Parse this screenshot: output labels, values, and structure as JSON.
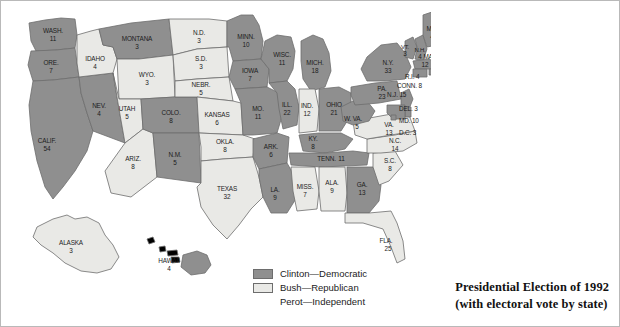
{
  "map": {
    "title_line1": "Presidential Election of 1992",
    "title_line2": "(with electoral vote by state)",
    "colors": {
      "clinton": "#8f8f8f",
      "bush": "#e9e9e6",
      "border": "#6d6d6d",
      "text": "#1c1c1c",
      "background": "#ffffff"
    }
  },
  "legend": {
    "items": [
      {
        "label": "Clinton—Democratic",
        "swatch": "#8f8f8f",
        "has_swatch": true
      },
      {
        "label": "Bush—Republican",
        "swatch": "#e9e9e6",
        "has_swatch": true
      },
      {
        "label": "Perot—Independent",
        "swatch": "",
        "has_swatch": false
      }
    ]
  },
  "states": [
    {
      "code": "WASH",
      "label": "WASH.",
      "votes": "11",
      "winner": "clinton"
    },
    {
      "code": "ORE",
      "label": "ORE.",
      "votes": "7",
      "winner": "clinton"
    },
    {
      "code": "CALIF",
      "label": "CALIF.",
      "votes": "54",
      "winner": "clinton"
    },
    {
      "code": "NEV",
      "label": "NEV.",
      "votes": "4",
      "winner": "clinton"
    },
    {
      "code": "IDAHO",
      "label": "IDAHO",
      "votes": "4",
      "winner": "bush"
    },
    {
      "code": "MONTANA",
      "label": "MONTANA",
      "votes": "3",
      "winner": "clinton"
    },
    {
      "code": "WYO",
      "label": "WYO.",
      "votes": "3",
      "winner": "bush"
    },
    {
      "code": "UTAH",
      "label": "UTAH",
      "votes": "5",
      "winner": "bush"
    },
    {
      "code": "ARIZ",
      "label": "ARIZ.",
      "votes": "8",
      "winner": "bush"
    },
    {
      "code": "COLO",
      "label": "COLO.",
      "votes": "8",
      "winner": "clinton"
    },
    {
      "code": "NM",
      "label": "N.M.",
      "votes": "5",
      "winner": "clinton"
    },
    {
      "code": "ND",
      "label": "N.D.",
      "votes": "3",
      "winner": "bush"
    },
    {
      "code": "SD",
      "label": "S.D.",
      "votes": "3",
      "winner": "bush"
    },
    {
      "code": "NEBR",
      "label": "NEBR.",
      "votes": "5",
      "winner": "bush"
    },
    {
      "code": "KANSAS",
      "label": "KANSAS",
      "votes": "6",
      "winner": "bush"
    },
    {
      "code": "OKLA",
      "label": "OKLA.",
      "votes": "8",
      "winner": "bush"
    },
    {
      "code": "TEXAS",
      "label": "TEXAS",
      "votes": "32",
      "winner": "bush"
    },
    {
      "code": "MINN",
      "label": "MINN.",
      "votes": "10",
      "winner": "clinton"
    },
    {
      "code": "IOWA",
      "label": "IOWA",
      "votes": "7",
      "winner": "clinton"
    },
    {
      "code": "MO",
      "label": "MO.",
      "votes": "11",
      "winner": "clinton"
    },
    {
      "code": "ARK",
      "label": "ARK.",
      "votes": "6",
      "winner": "clinton"
    },
    {
      "code": "LA",
      "label": "LA.",
      "votes": "9",
      "winner": "clinton"
    },
    {
      "code": "WISC",
      "label": "WISC.",
      "votes": "11",
      "winner": "clinton"
    },
    {
      "code": "ILL",
      "label": "ILL.",
      "votes": "22",
      "winner": "clinton"
    },
    {
      "code": "MICH",
      "label": "MICH.",
      "votes": "18",
      "winner": "clinton"
    },
    {
      "code": "IND",
      "label": "IND.",
      "votes": "12",
      "winner": "bush"
    },
    {
      "code": "OHIO",
      "label": "OHIO",
      "votes": "21",
      "winner": "clinton"
    },
    {
      "code": "KY",
      "label": "KY.",
      "votes": "8",
      "winner": "clinton"
    },
    {
      "code": "TENN",
      "label": "TENN.",
      "votes": "11",
      "winner": "clinton"
    },
    {
      "code": "MISS",
      "label": "MISS.",
      "votes": "7",
      "winner": "bush"
    },
    {
      "code": "ALA",
      "label": "ALA.",
      "votes": "9",
      "winner": "bush"
    },
    {
      "code": "GA",
      "label": "GA.",
      "votes": "13",
      "winner": "clinton"
    },
    {
      "code": "FLA",
      "label": "FLA.",
      "votes": "25",
      "winner": "bush"
    },
    {
      "code": "SC",
      "label": "S.C.",
      "votes": "8",
      "winner": "bush"
    },
    {
      "code": "NC",
      "label": "N.C.",
      "votes": "14",
      "winner": "bush"
    },
    {
      "code": "VA",
      "label": "VA.",
      "votes": "13",
      "winner": "bush"
    },
    {
      "code": "WVA",
      "label": "W. VA.",
      "votes": "5",
      "winner": "clinton"
    },
    {
      "code": "PA",
      "label": "PA.",
      "votes": "23",
      "winner": "clinton"
    },
    {
      "code": "NY",
      "label": "N.Y.",
      "votes": "33",
      "winner": "clinton"
    },
    {
      "code": "VT",
      "label": "VT.",
      "votes": "3",
      "winner": "clinton"
    },
    {
      "code": "NH",
      "label": "N.H.",
      "votes": "4",
      "winner": "clinton"
    },
    {
      "code": "ME",
      "label": "ME.",
      "votes": "4",
      "winner": "clinton"
    },
    {
      "code": "MASS",
      "label": "MASS.",
      "votes": "12",
      "winner": "clinton"
    },
    {
      "code": "RI",
      "label": "R.I. 4",
      "votes": "4",
      "winner": "clinton"
    },
    {
      "code": "CONN",
      "label": "CONN. 8",
      "votes": "8",
      "winner": "clinton"
    },
    {
      "code": "NJ",
      "label": "N.J. 15",
      "votes": "15",
      "winner": "clinton"
    },
    {
      "code": "DEL",
      "label": "DEL. 3",
      "votes": "3",
      "winner": "clinton"
    },
    {
      "code": "MD",
      "label": "MD. 10",
      "votes": "10",
      "winner": "clinton"
    },
    {
      "code": "DC",
      "label": "D.C. 3",
      "votes": "3",
      "winner": "clinton"
    },
    {
      "code": "ALASKA",
      "label": "ALASKA",
      "votes": "3",
      "winner": "bush"
    },
    {
      "code": "HAWAII",
      "label": "HAWAII",
      "votes": "4",
      "winner": "clinton"
    }
  ]
}
